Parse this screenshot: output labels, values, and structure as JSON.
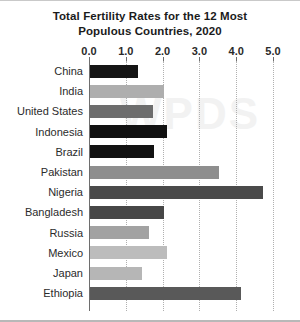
{
  "chart_data": {
    "type": "bar",
    "orientation": "horizontal",
    "title": "Total Fertility Rates for the 12 Most Populous Countries, 2020",
    "title_line_1": "Total Fertility Rates for the 12 Most",
    "title_line_2": "Populous Countries, 2020",
    "xlabel": "",
    "ylabel": "",
    "xlim": [
      0.0,
      5.0
    ],
    "xticks": [
      "0.0",
      "1.0",
      "2.0",
      "3.0",
      "4.0",
      "5.0"
    ],
    "xtick_values": [
      0.0,
      1.0,
      2.0,
      3.0,
      4.0,
      5.0
    ],
    "grid": true,
    "grid_style": "dotted-vertical",
    "legend": false,
    "categories": [
      "China",
      "India",
      "United States",
      "Indonesia",
      "Brazil",
      "Pakistan",
      "Nigeria",
      "Bangladesh",
      "Russia",
      "Mexico",
      "Japan",
      "Ethiopia"
    ],
    "values": [
      1.3,
      2.0,
      1.7,
      2.1,
      1.75,
      3.5,
      4.7,
      2.0,
      1.6,
      2.1,
      1.4,
      4.1
    ],
    "bar_colors": [
      "#151515",
      "#aeaeae",
      "#6d6d6d",
      "#111111",
      "#121212",
      "#8e8e8e",
      "#4a4a4a",
      "#474747",
      "#a2a2a2",
      "#bcbcbc",
      "#b6b6b6",
      "#595959"
    ]
  },
  "style": {
    "background": "#ffffff",
    "axis_color": "#6e6e6e",
    "grid_color": "#b0b0b0",
    "text_color": "#2b2b2b",
    "title_color": "#1b1b1b",
    "watermark_text": "WPDS"
  }
}
